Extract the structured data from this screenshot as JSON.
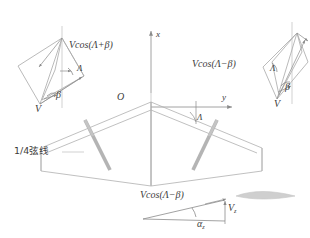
{
  "figure": {
    "title_text": "",
    "background": "#ffffff",
    "line_color": "#a8a8a8",
    "dark_line_color": "#8a8a8a",
    "spar_color": "#b4b4b4",
    "text_color": "#3c3c3c",
    "airfoil_color": "#c9c9c9"
  },
  "axes": {
    "origin_label": "O",
    "x_axis_label": "x",
    "y_axis_label": "y"
  },
  "wing": {
    "quarter_chord_note": "1/4弦线",
    "sweep_angle_label": "Λ"
  },
  "left_inset": {
    "velocity_label": "V",
    "component_label": "Vcos(Λ+β)",
    "sweep_angle_label": "Λ",
    "beta_angle_label": "β"
  },
  "right_inset": {
    "velocity_label": "V",
    "component_label": "Vcos(Λ−β)",
    "sweep_angle_label": "Λ",
    "beta_angle_label": "β"
  },
  "bottom_triangle": {
    "component_label": "Vcos(Λ−β)",
    "vertical_component_base": "V",
    "vertical_component_sub": "z",
    "angle_base": "α",
    "angle_sub": "z"
  },
  "airfoil": {
    "name": "airfoil-section"
  }
}
